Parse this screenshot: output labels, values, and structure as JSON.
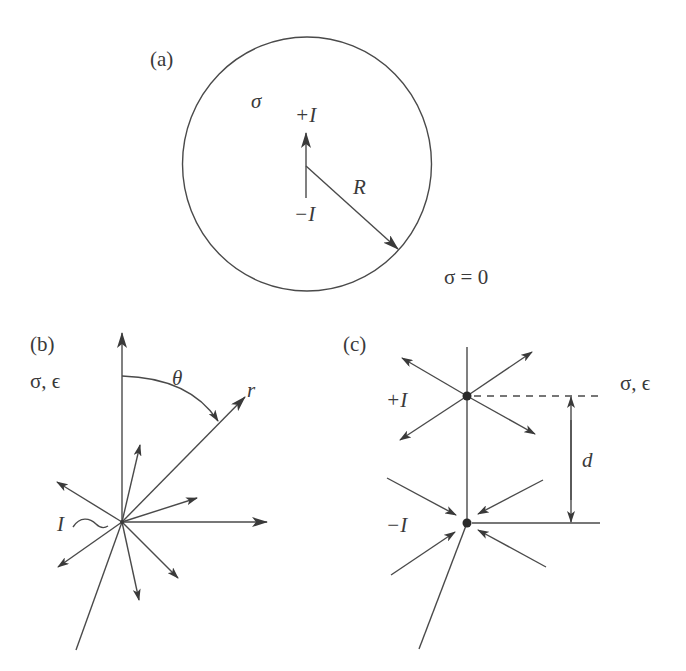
{
  "figure": {
    "panel_a": {
      "label": "(a)",
      "inside_conductivity": "σ",
      "outside_conductivity": "σ = 0",
      "source_plus": "+I",
      "source_minus": "−I",
      "radius_label": "R"
    },
    "panel_b": {
      "label": "(b)",
      "medium": "σ, ϵ",
      "angle_label": "θ",
      "radial_label": "r",
      "current_label": "I",
      "current_symbol": "~"
    },
    "panel_c": {
      "label": "(c)",
      "medium": "σ, ϵ",
      "source_plus": "+I",
      "source_minus": "−I",
      "separation_label": "d"
    }
  },
  "colors": {
    "line": "#4a4a4a",
    "text": "#3a3a3a",
    "background": "#ffffff"
  }
}
